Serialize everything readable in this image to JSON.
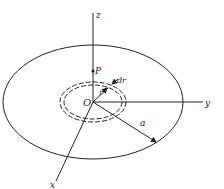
{
  "diagram": {
    "type": "geometry",
    "colors": {
      "stroke": "#222222",
      "background": "#ffffff"
    },
    "labels": {
      "z_axis": "z",
      "y_axis": "y",
      "x_axis": "x",
      "origin": "O",
      "point": "P",
      "ring_radius": "r",
      "ring_width": "dr",
      "disk_radius": "a"
    }
  }
}
